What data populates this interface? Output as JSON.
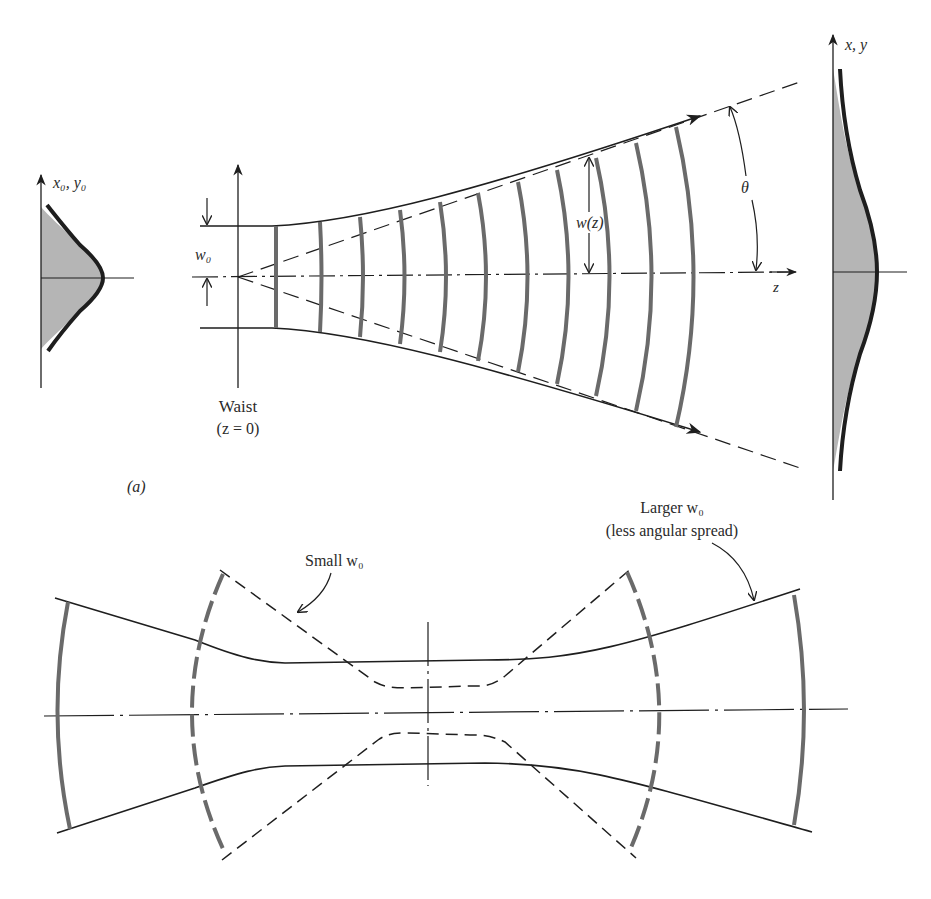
{
  "figure": {
    "panel_a": {
      "panel_label": "(a)",
      "input_profile": {
        "axis_label": "x₀, y₀"
      },
      "output_profile": {
        "axis_label": "x, y"
      },
      "waist_label": "w₀",
      "beam_radius_label": "w(z)",
      "divergence_angle_label": "θ",
      "propagation_axis_label": "z",
      "waist_caption_line1": "Waist",
      "waist_caption_line2": "(z = 0)"
    },
    "panel_b": {
      "small_waist_label": "Small w₀",
      "large_waist_label_line1": "Larger w₀",
      "large_waist_label_line2": "(less angular spread)"
    },
    "colors": {
      "line": "#1e1e1e",
      "wavefront": "#6a6a6a",
      "profile_fill": "#b5b5b5",
      "background": "#ffffff"
    }
  }
}
